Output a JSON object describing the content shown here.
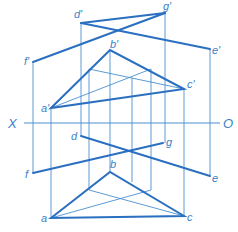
{
  "diagram": {
    "type": "orthographic-projection",
    "colors": {
      "line": "#2a6fc0",
      "thin": "#4a90d0",
      "label": "#3c7fc8"
    },
    "axis": {
      "left_label": "X",
      "right_label": "O"
    },
    "labels": {
      "a_prime": "a'",
      "b_prime": "b'",
      "c_prime": "c'",
      "d_prime": "d'",
      "e_prime": "e'",
      "f_prime": "f'",
      "g_prime": "g'",
      "a": "a",
      "b": "b",
      "c": "c",
      "d": "d",
      "e": "e",
      "f": "f",
      "g": "g"
    },
    "front_view": {
      "triangle": [
        "a'",
        "b'",
        "c'"
      ],
      "lines": [
        [
          "d'",
          "e'"
        ],
        [
          "f'",
          "g'"
        ]
      ]
    },
    "top_view": {
      "triangle": [
        "a",
        "b",
        "c"
      ],
      "lines": [
        [
          "d",
          "e"
        ],
        [
          "f",
          "g"
        ]
      ]
    }
  }
}
